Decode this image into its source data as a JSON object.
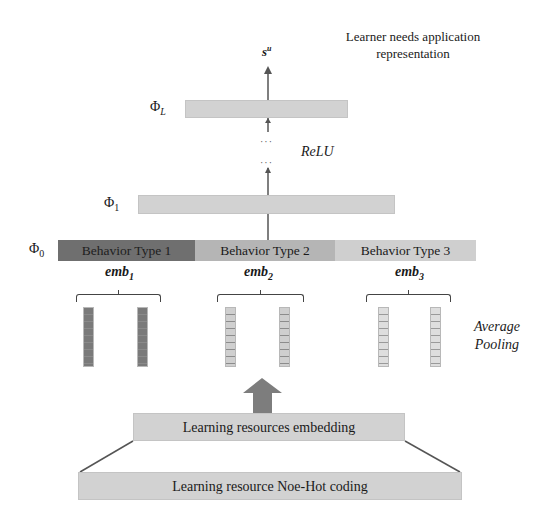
{
  "title": {
    "line1": "Learner needs application",
    "line2": "representation"
  },
  "output_symbol": {
    "base": "s",
    "superscript": "u"
  },
  "layers": {
    "phi_L": {
      "symbol": "Φ",
      "subscript": "L"
    },
    "phi_1": {
      "symbol": "Φ",
      "subscript": "1"
    },
    "phi_0": {
      "symbol": "Φ",
      "subscript": "0"
    }
  },
  "activation_label": "ReLU",
  "ellipsis": "···",
  "behavior_types": [
    {
      "label": "Behavior Type 1",
      "color": "#6f6f6f"
    },
    {
      "label": "Behavior Type 2",
      "color": "#b5b5b5"
    },
    {
      "label": "Behavior Type 3",
      "color": "#cfcfcf"
    }
  ],
  "embeddings": [
    {
      "base": "emb",
      "subscript": "1"
    },
    {
      "base": "emb",
      "subscript": "2"
    },
    {
      "base": "emb",
      "subscript": "3"
    }
  ],
  "pooling_label": {
    "line1": "Average",
    "line2": "Pooling"
  },
  "embedding_layer_label": "Learning resources embedding",
  "onehot_layer_label": "Learning resource Noe-Hot coding",
  "colors": {
    "bar_fill": "#d2d2d2",
    "arrow_fill": "#7d7d7d",
    "line": "#555555"
  }
}
